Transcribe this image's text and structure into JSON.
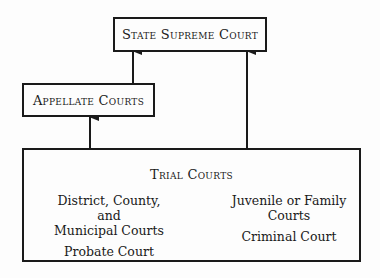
{
  "diagram": {
    "supreme": {
      "label": "State Supreme Court"
    },
    "appellate": {
      "label": "Appellate Courts"
    },
    "trial": {
      "label": "Trial Courts",
      "left_column": [
        "District, County,",
        "and",
        "Municipal Courts",
        "Probate Court"
      ],
      "right_column": [
        "Juvenile or Family",
        "Courts",
        "Criminal Court"
      ]
    },
    "edges": [
      {
        "from": "Appellate Courts",
        "to": "State Supreme Court"
      },
      {
        "from": "Trial Courts",
        "to": "Appellate Courts"
      },
      {
        "from": "Trial Courts",
        "to": "State Supreme Court"
      }
    ],
    "colors": {
      "line": "#1a1a1a",
      "background": "#fdfdfd"
    }
  }
}
